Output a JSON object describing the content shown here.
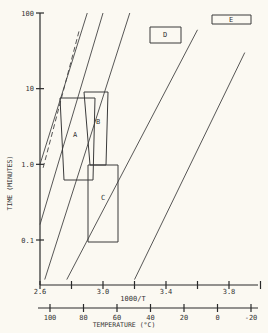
{
  "chart_data": {
    "type": "line",
    "title": "",
    "ylabel": "TIME (MINUTES)",
    "xlabel": "1000/T",
    "x2label": "TEMPERATURE (°C)",
    "yscale": "log",
    "ylim": [
      0.03,
      100
    ],
    "xlim": [
      2.6,
      4.0
    ],
    "yticks": [
      {
        "value": 100,
        "label": "100"
      },
      {
        "value": 10,
        "label": "10"
      },
      {
        "value": 1.0,
        "label": "1.0"
      },
      {
        "value": 0.1,
        "label": "0.1"
      }
    ],
    "xticks": [
      {
        "value": 2.6,
        "label": "2.6"
      },
      {
        "value": 2.8,
        "label": ""
      },
      {
        "value": 3.0,
        "label": "3.0"
      },
      {
        "value": 3.2,
        "label": ""
      },
      {
        "value": 3.4,
        "label": "3.4"
      },
      {
        "value": 3.6,
        "label": ""
      },
      {
        "value": 3.8,
        "label": "3.8"
      },
      {
        "value": 4.0,
        "label": ""
      }
    ],
    "x2ticks": [
      {
        "value": 100,
        "label": "100"
      },
      {
        "value": 80,
        "label": "80"
      },
      {
        "value": 60,
        "label": "60"
      },
      {
        "value": 40,
        "label": "40"
      },
      {
        "value": 20,
        "label": "20"
      },
      {
        "value": 0,
        "label": "0"
      },
      {
        "value": -20,
        "label": "-20"
      }
    ],
    "series": [
      {
        "name": "line-1",
        "style": "solid",
        "points": [
          [
            2.6,
            1.0
          ],
          [
            2.9,
            100
          ]
        ]
      },
      {
        "name": "line-1-dashed",
        "style": "dashed",
        "points": [
          [
            2.62,
            0.9
          ],
          [
            2.85,
            60
          ]
        ]
      },
      {
        "name": "line-2",
        "style": "solid",
        "points": [
          [
            2.6,
            0.16
          ],
          [
            3.0,
            100
          ]
        ]
      },
      {
        "name": "line-3",
        "style": "solid",
        "points": [
          [
            2.63,
            0.03
          ],
          [
            3.17,
            100
          ]
        ]
      },
      {
        "name": "line-4",
        "style": "solid",
        "points": [
          [
            2.77,
            0.03
          ],
          [
            3.6,
            60
          ]
        ]
      },
      {
        "name": "line-5",
        "style": "solid",
        "points": [
          [
            3.2,
            0.03
          ],
          [
            3.9,
            30
          ]
        ]
      }
    ],
    "regions": [
      {
        "label": "A",
        "time_range": [
          0.6,
          8
        ],
        "x_range": [
          2.66,
          2.77
        ]
      },
      {
        "label": "B",
        "time_range": [
          1.0,
          9.5
        ],
        "x_range": [
          2.74,
          2.85
        ]
      },
      {
        "label": "C",
        "time_range": [
          0.1,
          1.0
        ],
        "x_range": [
          2.76,
          2.86
        ]
      },
      {
        "label": "D",
        "time_range": [
          40,
          60
        ],
        "x_range": [
          3.3,
          3.5
        ]
      },
      {
        "label": "E",
        "time_range": [
          75,
          95
        ],
        "x_range": [
          3.7,
          3.9
        ]
      }
    ]
  }
}
